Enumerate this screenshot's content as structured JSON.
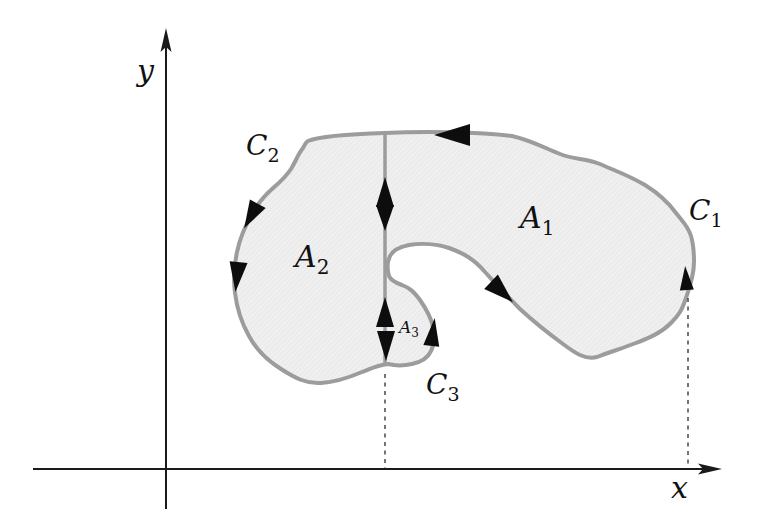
{
  "diagram": {
    "axes": {
      "x_label": "x",
      "y_label": "y"
    },
    "curves": [
      {
        "base": "C",
        "sub": "1"
      },
      {
        "base": "C",
        "sub": "2"
      },
      {
        "base": "C",
        "sub": "3"
      }
    ],
    "regions": [
      {
        "base": "A",
        "sub": "1"
      },
      {
        "base": "A",
        "sub": "2"
      },
      {
        "base": "A",
        "sub": "3"
      }
    ],
    "colors": {
      "background": "#ffffff",
      "region_fill": "#efefef",
      "region_stroke": "#9c9c9c",
      "axis": "#1a1a1a",
      "arrow": "#0d0d0d",
      "dashed_line": "#3a3a3a"
    }
  }
}
